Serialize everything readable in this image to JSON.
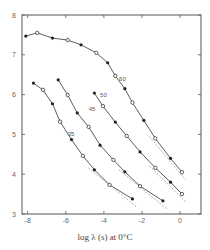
{
  "chart_data": {
    "type": "scatter",
    "title": "",
    "xlabel": "log λ (s) at 0°C",
    "ylabel": "",
    "xlim": [
      -8.3,
      1.1
    ],
    "ylim": [
      3,
      8
    ],
    "xticks": [
      -8,
      -6,
      -4,
      -2,
      0
    ],
    "xtick_labels": [
      "-8",
      "-6",
      "-4",
      "-2",
      "0"
    ],
    "yticks": [
      3,
      4,
      5,
      6,
      7,
      8
    ],
    "ytick_labels": [
      "3",
      "4",
      "5",
      "6",
      "7",
      "8"
    ],
    "grid": false,
    "legend": null,
    "series": [
      {
        "name": "60",
        "label_pos": [
          -3.2,
          6.35
        ],
        "x": [
          -8.1,
          -7.5,
          -6.7,
          -5.9,
          -5.2,
          -4.4,
          -3.8,
          -3.4,
          -2.9,
          -2.5,
          -1.9,
          -1.3,
          -0.5,
          0.1
        ],
        "y": [
          7.47,
          7.55,
          7.42,
          7.37,
          7.25,
          7.05,
          6.8,
          6.47,
          6.15,
          5.8,
          5.35,
          4.9,
          4.4,
          4.05
        ]
      },
      {
        "name": "50",
        "label_pos": [
          -4.2,
          5.95
        ],
        "x": [
          -4.5,
          -4.05,
          -3.4,
          -2.8,
          -2.1,
          -1.3,
          -0.5,
          0.1
        ],
        "y": [
          6.04,
          5.71,
          5.31,
          4.96,
          4.56,
          4.16,
          3.8,
          3.5
        ]
      },
      {
        "name": "45",
        "label_pos": [
          -4.8,
          5.6
        ],
        "x": [
          -6.4,
          -5.9,
          -5.4,
          -4.8,
          -4.2,
          -3.5,
          -2.9,
          -2.1,
          -0.9
        ],
        "y": [
          6.37,
          5.99,
          5.54,
          5.19,
          4.73,
          4.36,
          4.06,
          3.7,
          3.33
        ]
      },
      {
        "name": "35",
        "label_pos": [
          -5.9,
          4.95
        ],
        "x": [
          -7.7,
          -7.2,
          -6.7,
          -6.3,
          -5.7,
          -5.1,
          -4.5,
          -3.7,
          -2.5
        ],
        "y": [
          6.29,
          6.12,
          5.77,
          5.32,
          4.87,
          4.46,
          4.11,
          3.73,
          3.38
        ]
      }
    ]
  }
}
